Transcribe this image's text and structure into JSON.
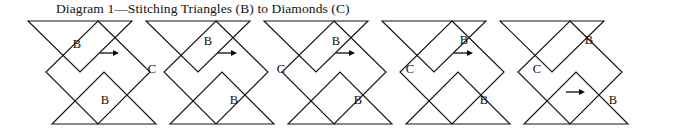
{
  "figure": {
    "title": "Diagram 1—Stitching Triangles (B) to Diamonds (C)",
    "width": 696,
    "height": 135,
    "background_color": "#ffffff",
    "line_color": "#141414",
    "label_color": "#111111"
  },
  "chart_data": {
    "type": "diagram",
    "title": "Diagram 1—Stitching Triangles (B) to Diamonds (C)",
    "units": 5,
    "unit_width": 118,
    "geometry": {
      "top_baseline_y": 21,
      "middle_y": 72,
      "bottom_baseline_y": 124,
      "half_width": 52,
      "unit_pitch": 118,
      "first_unit_x": 28
    },
    "piece_labels": [
      "B",
      "C",
      "B"
    ],
    "label_meanings": {
      "B": "triangle",
      "C": "diamond"
    },
    "units_detail": [
      {
        "index": 1,
        "top_triangle": "B",
        "diamond": "C",
        "bottom_triangle": "B",
        "top_arrow": true,
        "bottom_arrow": false
      },
      {
        "index": 2,
        "top_triangle": "B",
        "diamond": "C",
        "bottom_triangle": "B",
        "top_arrow": true,
        "bottom_arrow": false
      },
      {
        "index": 3,
        "top_triangle": "B",
        "diamond": "C",
        "bottom_triangle": "B",
        "top_arrow": true,
        "bottom_arrow": false
      },
      {
        "index": 4,
        "top_triangle": "B",
        "diamond": "C",
        "bottom_triangle": "B",
        "top_arrow": true,
        "bottom_arrow": false
      },
      {
        "index": 5,
        "top_triangle": "B",
        "diamond": "C",
        "bottom_triangle": "B",
        "top_arrow": false,
        "bottom_arrow": true
      }
    ],
    "arrows": [
      {
        "x1": 100,
        "x2": 119,
        "y": 53,
        "direction": "right",
        "row": "top"
      },
      {
        "x1": 218,
        "x2": 237,
        "y": 53,
        "direction": "right",
        "row": "top"
      },
      {
        "x1": 336,
        "x2": 355,
        "y": 53,
        "direction": "right",
        "row": "top"
      },
      {
        "x1": 454,
        "x2": 473,
        "y": 53,
        "direction": "right",
        "row": "top"
      },
      {
        "x1": 566,
        "x2": 585,
        "y": 92,
        "direction": "right",
        "row": "bottom"
      }
    ],
    "labels": [
      {
        "text": "B",
        "x": 77,
        "y": 45,
        "row": "top"
      },
      {
        "text": "C",
        "x": 152,
        "y": 70,
        "row": "middle"
      },
      {
        "text": "B",
        "x": 105,
        "y": 101,
        "row": "bottom"
      },
      {
        "text": "B",
        "x": 208,
        "y": 42,
        "row": "top"
      },
      {
        "text": "C",
        "x": 281,
        "y": 70,
        "row": "middle"
      },
      {
        "text": "B",
        "x": 234,
        "y": 101,
        "row": "bottom"
      },
      {
        "text": "B",
        "x": 336,
        "y": 42,
        "row": "top"
      },
      {
        "text": "C",
        "x": 410,
        "y": 70,
        "row": "middle"
      },
      {
        "text": "B",
        "x": 358,
        "y": 101,
        "row": "bottom"
      },
      {
        "text": "B",
        "x": 464,
        "y": 41,
        "row": "top"
      },
      {
        "text": "C",
        "x": 537,
        "y": 70,
        "row": "middle"
      },
      {
        "text": "B",
        "x": 484,
        "y": 101,
        "row": "bottom"
      },
      {
        "text": "B",
        "x": 589,
        "y": 41,
        "row": "top"
      },
      {
        "text": "B",
        "x": 613,
        "y": 101,
        "row": "bottom"
      }
    ]
  }
}
